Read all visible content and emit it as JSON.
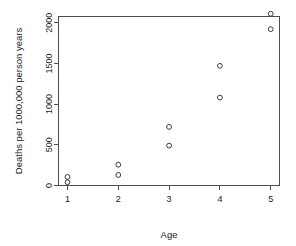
{
  "chart_data": {
    "type": "scatter",
    "title": "",
    "xlabel": "Age",
    "ylabel": "Deaths per 1000,000 person years",
    "xlim": [
      0.55,
      5.45
    ],
    "ylim": [
      -60,
      2200
    ],
    "grid": false,
    "legend": null,
    "xticks": [
      "1",
      "2",
      "3",
      "4",
      "5"
    ],
    "xtick_values": [
      1,
      2,
      3,
      4,
      5
    ],
    "yticks": [
      "0",
      "500",
      "1000",
      "1500",
      "2000"
    ],
    "ytick_values": [
      0,
      500,
      1000,
      1500,
      2000
    ],
    "marker": "open-circle",
    "marker_color": "#3a3a3a",
    "points": [
      {
        "x": 1,
        "y": 40
      },
      {
        "x": 1,
        "y": 105
      },
      {
        "x": 2,
        "y": 130
      },
      {
        "x": 2,
        "y": 255
      },
      {
        "x": 3,
        "y": 490
      },
      {
        "x": 3,
        "y": 720
      },
      {
        "x": 4,
        "y": 1080
      },
      {
        "x": 4,
        "y": 1470
      },
      {
        "x": 5,
        "y": 1920
      },
      {
        "x": 5,
        "y": 2110
      }
    ],
    "series": [
      {
        "name": "Deaths by age group",
        "x": [
          1,
          1,
          2,
          2,
          3,
          3,
          4,
          4,
          5,
          5
        ],
        "values": [
          40,
          105,
          130,
          255,
          490,
          720,
          1080,
          1470,
          1920,
          2110
        ]
      }
    ]
  },
  "figure": {
    "background_color": "#ffffff",
    "axis_color": "#4d4d4d",
    "text_color": "#1a1a1a"
  }
}
